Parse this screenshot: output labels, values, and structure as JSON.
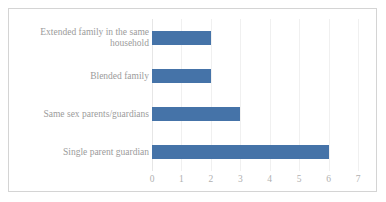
{
  "chart_data": {
    "type": "bar",
    "orientation": "horizontal",
    "title": "",
    "xlabel": "",
    "ylabel": "",
    "xlim": [
      0,
      7
    ],
    "grid": true,
    "legend": false,
    "bar_color": "#4573a8",
    "categories": [
      "Extended family in the same household",
      "Blended family",
      "Same sex parents/guardians",
      "Single parent guardian"
    ],
    "values": [
      2,
      2,
      3,
      6
    ],
    "xticks": [
      "0",
      "1",
      "2",
      "3",
      "4",
      "5",
      "6",
      "7"
    ],
    "xtick_values": [
      0,
      1,
      2,
      3,
      4,
      5,
      6,
      7
    ]
  },
  "frame": {
    "border_color": "#d4d4d4"
  }
}
